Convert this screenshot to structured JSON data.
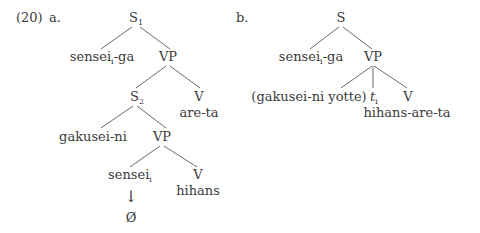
{
  "example_number": "(20)",
  "panels": [
    {
      "label": "a.",
      "nodes": {
        "root": {
          "cat": "S",
          "sub": "1"
        },
        "subj": {
          "text": "sensei",
          "sub": "i",
          "suffix": "-ga"
        },
        "vp1": {
          "cat": "VP"
        },
        "s2": {
          "cat": "S",
          "sub": "2"
        },
        "v1": {
          "cat": "V",
          "word": "are-ta"
        },
        "obj": {
          "text": "gakusei-ni"
        },
        "vp2": {
          "cat": "VP"
        },
        "emb_subj": {
          "text": "sensei",
          "sub": "i"
        },
        "v2": {
          "cat": "V",
          "word": "hihans"
        },
        "arrow": "↓",
        "null": "Ø"
      }
    },
    {
      "label": "b.",
      "nodes": {
        "root": {
          "cat": "S"
        },
        "subj": {
          "text": "sensei",
          "sub": "i",
          "suffix": "-ga"
        },
        "vp": {
          "cat": "VP"
        },
        "agent": {
          "text": "(gakusei-ni yotte)"
        },
        "trace": {
          "text": "t",
          "sub": "i"
        },
        "v": {
          "cat": "V",
          "word": "hihans-are-ta"
        }
      }
    }
  ]
}
